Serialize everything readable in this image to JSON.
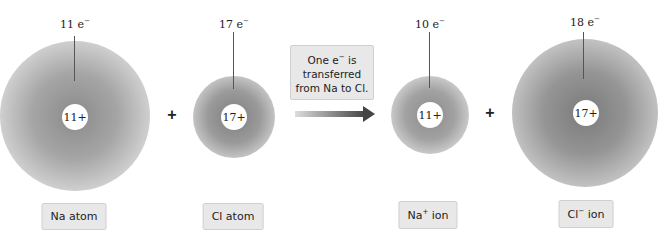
{
  "diagram": {
    "particles": [
      {
        "id": "na-atom",
        "electrons": "11 e",
        "electron_sup": "−",
        "nucleus": "11+",
        "label": "Na atom",
        "label_sup": ""
      },
      {
        "id": "cl-atom",
        "electrons": "17 e",
        "electron_sup": "−",
        "nucleus": "17+",
        "label": "Cl atom",
        "label_sup": ""
      },
      {
        "id": "na-ion",
        "electrons": "10 e",
        "electron_sup": "−",
        "nucleus": "11+",
        "label_pre": "Na",
        "label_sup": "+",
        "label_post": " ion"
      },
      {
        "id": "cl-ion",
        "electrons": "18 e",
        "electron_sup": "−",
        "nucleus": "17+",
        "label_pre": "Cl",
        "label_sup": "−",
        "label_post": " ion"
      }
    ],
    "plus_signs": [
      "+",
      "+"
    ],
    "callout": {
      "line1_pre": "One e",
      "line1_sup": "−",
      "line1_post": " is",
      "line2": "transferred",
      "line3": "from Na to Cl."
    },
    "colors": {
      "cloud": "#8a8a8a",
      "box": "#e8e8e8",
      "arrow": "#444444"
    }
  }
}
